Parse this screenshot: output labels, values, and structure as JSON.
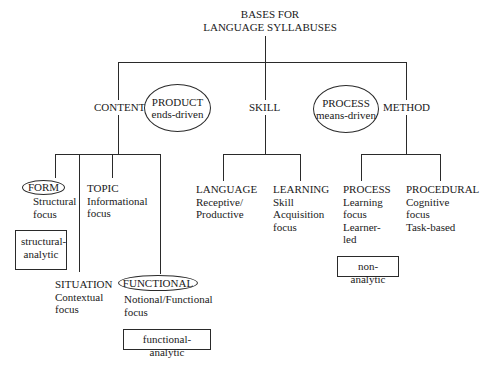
{
  "title": {
    "line1": "BASES FOR",
    "line2": "LANGUAGE SYLLABUSES"
  },
  "branches": {
    "content": {
      "label": "CONTENT",
      "ellipse": {
        "line1": "PRODUCT",
        "line2": "ends-driven"
      },
      "children": {
        "form": {
          "label": "FORM",
          "desc1": "Structural",
          "desc2": "focus"
        },
        "topic": {
          "label": "TOPIC",
          "desc1": "Informational",
          "desc2": "focus"
        },
        "situation": {
          "label": "SITUATION",
          "desc1": "Contextual",
          "desc2": "focus"
        },
        "functional": {
          "label": "FUNCTIONAL",
          "desc1": "Notional/Functional",
          "desc2": "focus"
        }
      },
      "boxes": {
        "structural_line1": "structural-",
        "structural_line2": "analytic",
        "functional": "functional-analytic"
      }
    },
    "skill": {
      "label": "SKILL",
      "children": {
        "language": {
          "label": "LANGUAGE",
          "desc1": "Receptive/",
          "desc2": "Productive"
        },
        "learning": {
          "label": "LEARNING",
          "desc1": "Skill",
          "desc2": "Acquisition",
          "desc3": "focus"
        }
      }
    },
    "method": {
      "label": "METHOD",
      "ellipse": {
        "line1": "PROCESS",
        "line2": "means-driven"
      },
      "children": {
        "process": {
          "label": "PROCESS",
          "desc1": "Learning",
          "desc2": "focus",
          "desc3": "Learner-",
          "desc4": "led"
        },
        "procedural": {
          "label": "PROCEDURAL",
          "desc1": "Cognitive",
          "desc2": "focus",
          "desc3": "Task-based"
        }
      },
      "boxes": {
        "non_analytic": "non-analytic"
      }
    }
  }
}
